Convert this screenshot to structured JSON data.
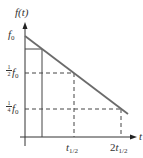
{
  "diagram": {
    "type": "exponential-decay-linear-plot",
    "y_axis_label": "f(t)",
    "x_axis_label": "t",
    "y_labels": [
      {
        "id": "f0",
        "text": "f",
        "sub": "0"
      },
      {
        "id": "half",
        "num": "1",
        "den": "2",
        "text": "f",
        "sub": "0"
      },
      {
        "id": "quarter",
        "num": "1",
        "den": "4",
        "text": "f",
        "sub": "0"
      }
    ],
    "x_labels": [
      {
        "id": "t_half",
        "text": "t",
        "sub": "1/2"
      },
      {
        "id": "two_t_half",
        "prefix": "2",
        "text": "t",
        "sub": "1/2"
      }
    ],
    "colors": {
      "line": "#6b6b6b",
      "axis": "#333333",
      "dash": "#444444"
    }
  }
}
